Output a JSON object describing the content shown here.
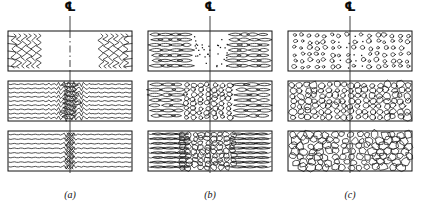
{
  "figure": {
    "centerline_symbol": "℄",
    "columns": [
      {
        "id": "a",
        "label": "(a)",
        "panels": [
          {
            "stage": 1,
            "description": "Deformed fibrous structure; wavy zigzag flow lines confined to left and right edges, clear undeformed centre band"
          },
          {
            "stage": 2,
            "description": "Flow lines extend across full width with a dense wavy lens-shaped cluster concentrated on the centreline"
          },
          {
            "stage": 3,
            "description": "Nearly straight horizontal flow lines with a narrow tight zigzag band remaining at the centreline"
          }
        ]
      },
      {
        "id": "b",
        "label": "(b)",
        "panels": [
          {
            "stage": 1,
            "description": "Elongated spindle-shaped deformed grains at the edges with fine nucleation dots appearing along the centre"
          },
          {
            "stage": 2,
            "description": "Elongated grains at edges, equiaxed recrystallized circular grains growing in the centre band"
          },
          {
            "stage": 3,
            "description": "Thin elongated grains at the outer edges, wide dense cellular recrystallized band through the centre"
          }
        ]
      },
      {
        "id": "c",
        "label": "(c)",
        "panels": [
          {
            "stage": 1,
            "description": "Fine scattered equiaxed nuclei distributed across the whole section, finest near the centreline"
          },
          {
            "stage": 2,
            "description": "Grown rounded equiaxed grains packed across the section with polygonal boundaries forming"
          },
          {
            "stage": 3,
            "description": "Fully recrystallized coarse polygonal grain structure filling the entire section"
          }
        ]
      }
    ],
    "colors": {
      "line": "#1a1a1a",
      "frame": "#111111",
      "centerline": "#2a2a2a",
      "background": "#ffffff"
    },
    "panel_geometry": {
      "rows_y": [
        31,
        81,
        131
      ],
      "panel_height": 40,
      "panel_left": 8,
      "panel_width": 124
    }
  }
}
